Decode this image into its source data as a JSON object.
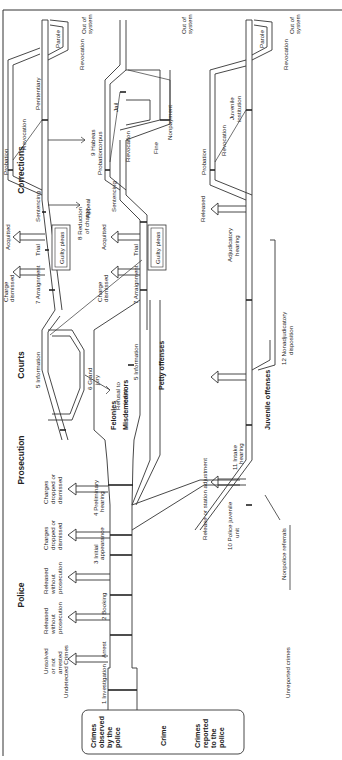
{
  "headers": {
    "police": "Police",
    "prosecution": "Prosecution",
    "courts": "Courts",
    "corrections": "Corrections"
  },
  "entry": {
    "crimes_observed": [
      "Crimes",
      "observed",
      "by the",
      "police"
    ],
    "crime": "Crime",
    "crimes_reported": [
      "Crimes",
      "reported",
      "to the",
      "police"
    ],
    "undetected": "Undetected Crimes",
    "unreported": "Unreported crimes"
  },
  "categories": {
    "felonies": "Felonies",
    "misdemeanors": "Misdemeanors",
    "petty": "Petty offenses",
    "juvenile": "Juvenile offenses"
  },
  "steps": {
    "s1": "1  Investigation",
    "s2": "2  Booking",
    "s3": [
      "3  Initial",
      "appearance"
    ],
    "s4": [
      "4  Preliminary",
      "hearing"
    ],
    "s5": "5  Information",
    "s5b": "5  Information",
    "s6": [
      "6  Grand",
      "jury"
    ],
    "s7": "7  Arraignment",
    "s7b": "7  Arraignment",
    "s8": [
      "8  Reduction",
      "of charge"
    ],
    "s9": [
      "9  Habeas",
      "corpus"
    ],
    "s10": [
      "10  Police juvenile",
      "unit"
    ],
    "s11": [
      "11  Intake",
      "hearing"
    ],
    "s12": [
      "12  Nonadjudicatory",
      "disposition"
    ],
    "arrest": "Arrest"
  },
  "exits": {
    "unsolved": [
      "Unsolved",
      "or not",
      "arrested"
    ],
    "released1": [
      "Released",
      "without",
      "prosecution"
    ],
    "released2": [
      "Released",
      "without",
      "prosecution"
    ],
    "dropped1": [
      "Charges",
      "dropped or",
      "dismissed"
    ],
    "dropped2": [
      "Charges",
      "dropped or",
      "dismissed"
    ],
    "refusal": [
      "Refusal to",
      "indict"
    ],
    "dismissed1": [
      "Charge",
      "dismissed"
    ],
    "dismissed2": [
      "Charge",
      "dismissed"
    ],
    "acquitted1": "Acquitted",
    "acquitted2": "Acquitted",
    "appeal": "Appeal",
    "released_juv": "Released",
    "release_station": "Release or station adjustment",
    "nonpolice": "Nonpolice referrals",
    "out1": [
      "Out of",
      "system"
    ],
    "out2": [
      "Out of",
      "system"
    ],
    "out3": [
      "Out of",
      "system"
    ]
  },
  "nodes": {
    "trial1": "Trial",
    "trial2": "Trial",
    "guilty1": "Guilty pleas",
    "guilty2": "Guilty pleas",
    "sentencing1": "Sentencing",
    "sentencing2": "Sentencing",
    "adjudicatory": [
      "Adjudicatory",
      "hearing"
    ],
    "probation1": "Probation",
    "probation2": "Probation",
    "probation3": "Probation",
    "revocation1": "Revocation",
    "revocation2": "Revocation",
    "revocation3": "Revocation",
    "revocation_parole1": "Revocation",
    "revocation_parole2": "Revocation",
    "penitentiary": "Penitentiary",
    "jail": "Jail",
    "juvenile_inst": [
      "Juvenile",
      "institution"
    ],
    "parole1": "Parole",
    "parole2": "Parole",
    "fine": "Fine",
    "nonpayment": "Nonpayment"
  }
}
